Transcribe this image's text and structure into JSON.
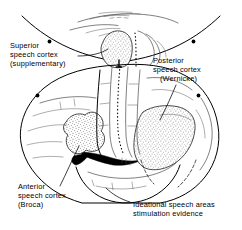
{
  "figure": {
    "background_color": "#ffffff",
    "ink_color": "#000000",
    "width": 242,
    "height": 230
  },
  "labels": {
    "superior": {
      "name": "superior-speech-cortex",
      "lines": [
        "Superior",
        "speech cortex",
        "(supplementary)"
      ],
      "line1": "Superior",
      "line2": "speech cortex",
      "line3": "(supplementary)",
      "x": 10,
      "y": 48
    },
    "posterior": {
      "name": "posterior-speech-cortex",
      "lines": [
        "Posterior",
        "speech cortex",
        "(Wernicke)"
      ],
      "line1": "Posterior",
      "line2": "speech cortex",
      "line3": "(Wernicke)",
      "x": 153,
      "y": 63
    },
    "anterior": {
      "name": "anterior-speech-cortex",
      "lines": [
        "Anterior",
        "speech cortex",
        "(Broca)"
      ],
      "line1": "Anterior",
      "line2": "speech cortex",
      "line3": "(Broca)",
      "x": 18,
      "y": 189
    },
    "ideational": {
      "name": "ideational-speech-areas",
      "lines": [
        "Ideational speech areas",
        "stimulation evidence"
      ],
      "line1": "Ideational speech areas",
      "line2": "stimulation evidence",
      "x": 133,
      "y": 206
    }
  },
  "regions": [
    {
      "name": "supplementary-motor-area",
      "label_key": "superior",
      "shading": "stipple",
      "view": "medial-superior"
    },
    {
      "name": "wernicke-area",
      "label_key": "posterior",
      "shading": "stipple",
      "view": "lateral"
    },
    {
      "name": "broca-area",
      "label_key": "anterior",
      "shading": "stipple",
      "view": "lateral"
    },
    {
      "name": "sylvian-fissure",
      "shading": "solid-black",
      "view": "lateral"
    }
  ],
  "views": {
    "top": {
      "name": "medial-superior-view",
      "description": "Superior medial section showing supplementary speech cortex"
    },
    "main": {
      "name": "lateral-hemisphere-view",
      "description": "Left lateral hemisphere showing Broca and Wernicke areas"
    }
  }
}
